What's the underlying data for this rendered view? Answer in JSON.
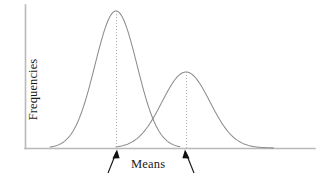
{
  "figure": {
    "background_color": "#ffffff",
    "width": 320,
    "height": 179,
    "axis_color": "#b9b9b9",
    "curve_color": "#8d8d8d",
    "mean_line_color": "#b0b0b0",
    "arrow_color": "#111111",
    "text_color": "#1a1a1a"
  },
  "labels": {
    "y_axis": "Frequencies",
    "x_axis": "Means"
  },
  "chart_data": {
    "type": "line",
    "title": "",
    "xlabel": "Means",
    "ylabel": "Frequencies",
    "grid": false,
    "legend": "none",
    "axis_ticks": [],
    "xlim": [
      0,
      320
    ],
    "ylim": [
      0,
      179
    ],
    "annotations": [
      {
        "name": "mean-line-1",
        "style": "dotted-vertical",
        "x": 116,
        "y_top": 11,
        "y_bottom": 148
      },
      {
        "name": "mean-line-2",
        "style": "dotted-vertical",
        "x": 186,
        "y_top": 72,
        "y_bottom": 148
      },
      {
        "name": "arrow-to-mean-1",
        "style": "arrow",
        "from": [
          118,
          172
        ],
        "to": [
          116,
          150
        ],
        "label": "Means"
      },
      {
        "name": "arrow-to-mean-2",
        "style": "arrow",
        "from": [
          184,
          172
        ],
        "to": [
          186,
          150
        ],
        "label": "Means"
      }
    ],
    "series": [
      {
        "name": "distribution-1",
        "description": "Taller left normal curve",
        "peak_x": 116,
        "peak_y": 11,
        "baseline_y": 148,
        "amplitude": 137,
        "sigma": 21,
        "x_start": 50,
        "x_end": 180
      },
      {
        "name": "distribution-2",
        "description": "Shorter right normal curve",
        "peak_x": 186,
        "peak_y": 72,
        "baseline_y": 148,
        "amplitude": 76,
        "sigma": 24,
        "x_start": 116,
        "x_end": 274
      }
    ]
  }
}
